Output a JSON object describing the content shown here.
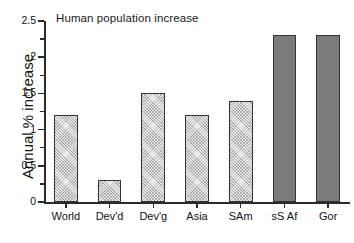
{
  "chart_data": {
    "type": "bar",
    "title": "Human population increase",
    "xlabel": "",
    "ylabel": "Annual % increase",
    "categories": [
      "World",
      "Dev'd",
      "Dev'g",
      "Asia",
      "SAm",
      "sS Af",
      "Gor"
    ],
    "values": [
      1.2,
      0.3,
      1.5,
      1.2,
      1.4,
      2.3,
      2.3
    ],
    "series": [
      {
        "name": "Annual % increase",
        "values": [
          1.2,
          0.3,
          1.5,
          1.2,
          1.4,
          2.3,
          2.3
        ]
      }
    ],
    "bar_styles": [
      "hatched",
      "hatched",
      "hatched",
      "hatched",
      "hatched",
      "solid",
      "solid"
    ],
    "ylim": [
      0,
      2.5
    ],
    "yticks": [
      0,
      0.5,
      1,
      1.5,
      2,
      2.5
    ],
    "ytick_labels": [
      "0",
      "0.5",
      "1",
      "1.5",
      "2",
      "2.5"
    ],
    "grid": false,
    "legend": false,
    "colors": {
      "hatched_fill": "#e9e9e9",
      "solid_fill": "#7b7b7b",
      "bar_outline": "#343434",
      "axis": "#2b2b2b",
      "text": "#111111",
      "background": "#ffffff"
    }
  }
}
